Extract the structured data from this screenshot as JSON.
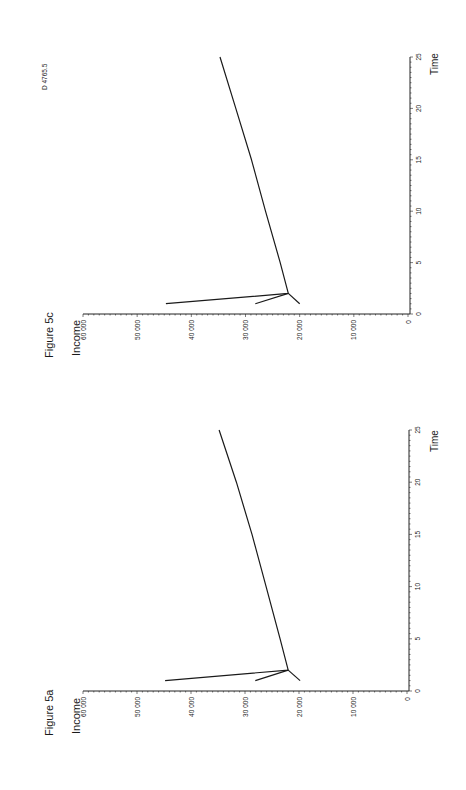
{
  "page": {
    "orientation": "rotated-90-ccw",
    "doc_code": "D 4765.5"
  },
  "figures": [
    {
      "id": "fig5c",
      "title": "Figure 5c",
      "ylabel": "Income",
      "xlabel": "Time",
      "y_ticks": [
        "60 000",
        "50 000",
        "40 000",
        "30 000",
        "20 000",
        "10 000",
        "0"
      ],
      "x_ticks": [
        "0",
        "5",
        "10",
        "15",
        "20",
        "25"
      ]
    },
    {
      "id": "fig5a",
      "title": "Figure 5a",
      "ylabel": "Income",
      "xlabel": "Time",
      "y_ticks": [
        "60 000",
        "50 000",
        "40 000",
        "30 000",
        "20 000",
        "10 000",
        "0"
      ],
      "x_ticks": [
        "0",
        "5",
        "10",
        "15",
        "20",
        "25"
      ]
    }
  ],
  "chart_data": [
    {
      "type": "line",
      "title": "Figure 5c",
      "xlabel": "Time",
      "ylabel": "Income",
      "xlim": [
        0,
        25
      ],
      "ylim": [
        0,
        60000
      ],
      "grid": false,
      "legend": "none",
      "series": [
        {
          "name": "path-high-start",
          "x": [
            1,
            2,
            5,
            10,
            15,
            20,
            25
          ],
          "y": [
            44700,
            22100,
            23600,
            26300,
            28900,
            31800,
            34700
          ]
        },
        {
          "name": "path-mid-start",
          "x": [
            1,
            2
          ],
          "y": [
            28200,
            22100
          ]
        },
        {
          "name": "path-low-start",
          "x": [
            1,
            2
          ],
          "y": [
            20000,
            22100
          ]
        }
      ]
    },
    {
      "type": "line",
      "title": "Figure 5a",
      "xlabel": "Time",
      "ylabel": "Income",
      "xlim": [
        0,
        25
      ],
      "ylim": [
        0,
        60000
      ],
      "grid": false,
      "legend": "none",
      "series": [
        {
          "name": "path-high-start",
          "x": [
            1,
            2,
            5,
            10,
            15,
            20,
            25
          ],
          "y": [
            44800,
            22000,
            23500,
            26100,
            28700,
            31600,
            34800
          ]
        },
        {
          "name": "path-mid-start",
          "x": [
            1,
            2
          ],
          "y": [
            28100,
            22000
          ]
        },
        {
          "name": "path-low-start",
          "x": [
            1,
            2
          ],
          "y": [
            19800,
            22000
          ]
        }
      ]
    }
  ]
}
